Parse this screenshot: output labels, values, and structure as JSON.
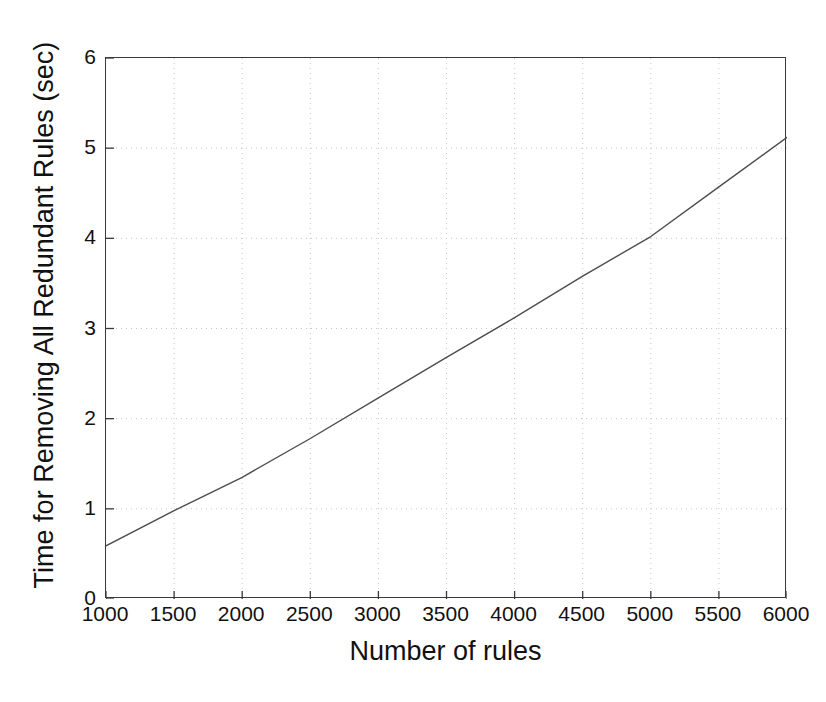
{
  "chart_data": {
    "type": "line",
    "title": "",
    "xlabel": "Number of rules",
    "ylabel": "Time for Removing All Redundant Rules (sec)",
    "xlim": [
      1000,
      6000
    ],
    "ylim": [
      0,
      6
    ],
    "xticks": [
      1000,
      1500,
      2000,
      2500,
      3000,
      3500,
      4000,
      4500,
      5000,
      5500,
      6000
    ],
    "xticklabels": [
      "1000",
      "1500",
      "2000",
      "2500",
      "3000",
      "3500",
      "4000",
      "4500",
      "5000",
      "5500",
      "6000"
    ],
    "yticks": [
      0,
      1,
      2,
      3,
      4,
      5,
      6
    ],
    "yticklabels": [
      "0",
      "1",
      "2",
      "3",
      "4",
      "5",
      "6"
    ],
    "grid": true,
    "grid_style": "dotted",
    "legend": null,
    "line_color": "#4d4d4d",
    "line_width": 1.4,
    "series": [
      {
        "name": "Time for removing all redundant rules",
        "x": [
          1000,
          1500,
          2000,
          2500,
          3000,
          3500,
          4000,
          4500,
          5000,
          5500,
          6000
        ],
        "values": [
          0.59,
          0.98,
          1.35,
          1.78,
          2.23,
          2.68,
          3.12,
          3.58,
          4.02,
          4.57,
          5.12
        ]
      }
    ]
  }
}
